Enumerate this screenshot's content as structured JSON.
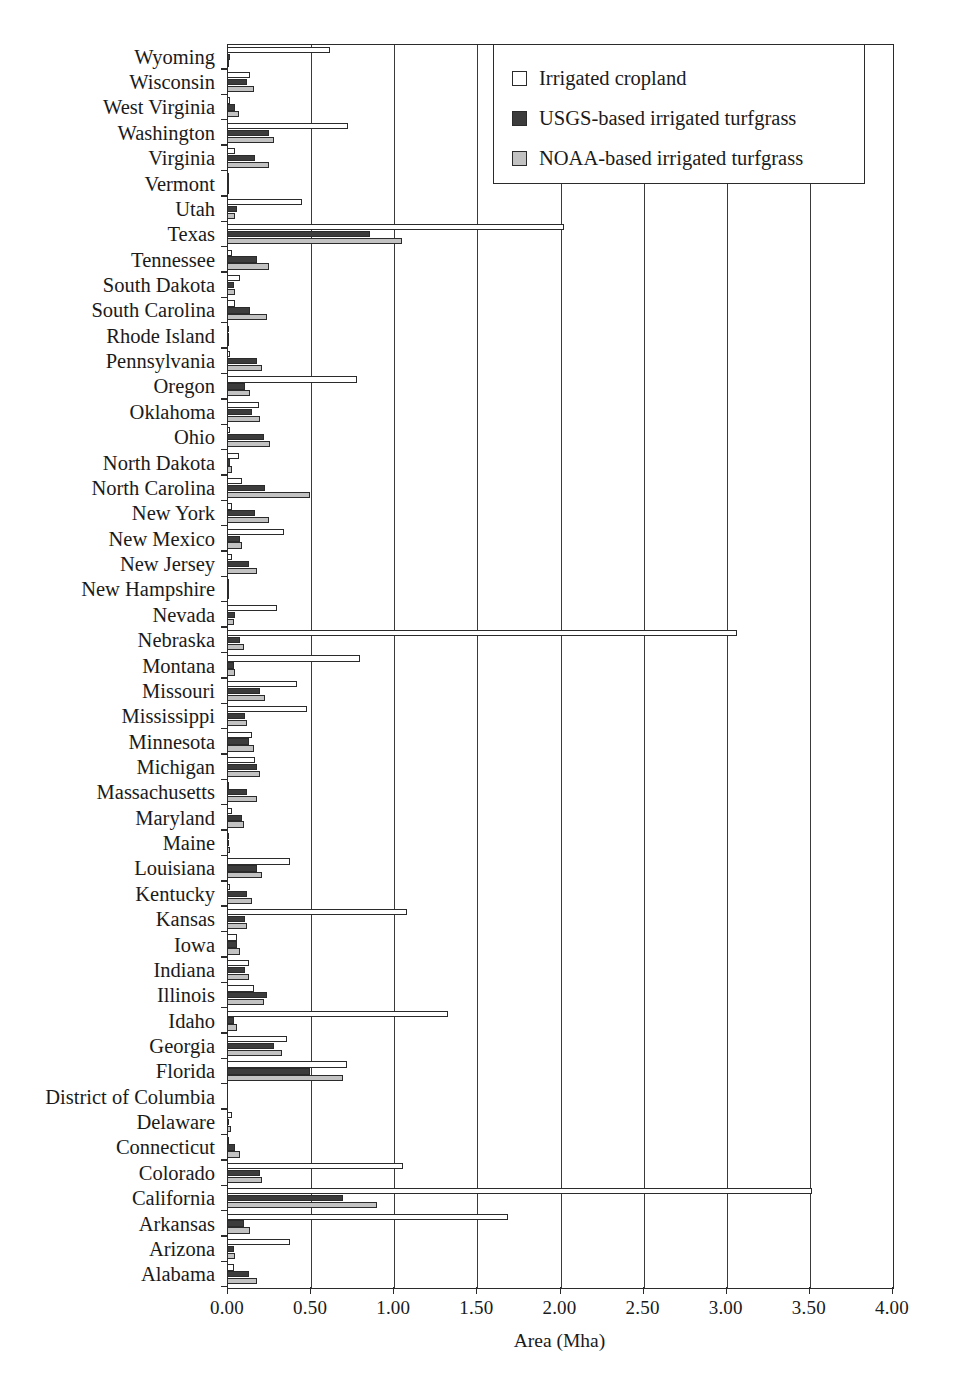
{
  "chart_data": {
    "type": "bar",
    "orientation": "horizontal",
    "title": "",
    "xlabel": "Area (Mha)",
    "ylabel": "",
    "xlim": [
      0.0,
      4.0
    ],
    "xticks": [
      "0.00",
      "0.50",
      "1.00",
      "1.50",
      "2.00",
      "2.50",
      "3.00",
      "3.50",
      "4.00"
    ],
    "xtick_values": [
      0.0,
      0.5,
      1.0,
      1.5,
      2.0,
      2.5,
      3.0,
      3.5,
      4.0
    ],
    "grid": "vertical",
    "legend_position": "top-right",
    "legend": [
      {
        "label": "Irrigated cropland",
        "color": "#ffffff"
      },
      {
        "label": "USGS-based irrigated turfgrass",
        "color": "#3c3c3c"
      },
      {
        "label": "NOAA-based irrigated turfgrass",
        "color": "#c2c2c2"
      }
    ],
    "categories": [
      "Wyoming",
      "Wisconsin",
      "West Virginia",
      "Washington",
      "Virginia",
      "Vermont",
      "Utah",
      "Texas",
      "Tennessee",
      "South Dakota",
      "South Carolina",
      "Rhode Island",
      "Pennsylvania",
      "Oregon",
      "Oklahoma",
      "Ohio",
      "North Dakota",
      "North Carolina",
      "New York",
      "New Mexico",
      "New Jersey",
      "New Hampshire",
      "Nevada",
      "Nebraska",
      "Montana",
      "Missouri",
      "Mississippi",
      "Minnesota",
      "Michigan",
      "Massachusetts",
      "Maryland",
      "Maine",
      "Louisiana",
      "Kentucky",
      "Kansas",
      "Iowa",
      "Indiana",
      "Illinois",
      "Idaho",
      "Georgia",
      "Florida",
      "District of Columbia",
      "Delaware",
      "Connecticut",
      "Colorado",
      "California",
      "Arkansas",
      "Arizona",
      "Alabama"
    ],
    "series": [
      {
        "name": "Irrigated cropland",
        "values": [
          0.62,
          0.14,
          0.02,
          0.73,
          0.05,
          0.005,
          0.45,
          2.03,
          0.03,
          0.08,
          0.05,
          0.005,
          0.02,
          0.78,
          0.19,
          0.02,
          0.07,
          0.09,
          0.03,
          0.34,
          0.03,
          0.004,
          0.3,
          3.07,
          0.8,
          0.42,
          0.48,
          0.15,
          0.17,
          0.01,
          0.03,
          0.01,
          0.38,
          0.02,
          1.08,
          0.06,
          0.13,
          0.16,
          1.33,
          0.36,
          0.72,
          0.0,
          0.03,
          0.01,
          1.06,
          3.52,
          1.69,
          0.38,
          0.04
        ]
      },
      {
        "name": "USGS-based irrigated turfgrass",
        "values": [
          0.02,
          0.12,
          0.05,
          0.25,
          0.17,
          0.002,
          0.06,
          0.86,
          0.18,
          0.04,
          0.14,
          0.01,
          0.18,
          0.11,
          0.15,
          0.22,
          0.02,
          0.23,
          0.17,
          0.08,
          0.13,
          0.012,
          0.05,
          0.08,
          0.04,
          0.2,
          0.11,
          0.13,
          0.18,
          0.12,
          0.09,
          0.015,
          0.18,
          0.12,
          0.11,
          0.06,
          0.11,
          0.24,
          0.04,
          0.28,
          0.5,
          0.0,
          0.015,
          0.05,
          0.2,
          0.7,
          0.1,
          0.04,
          0.13
        ]
      },
      {
        "name": "NOAA-based irrigated turfgrass",
        "values": [
          0.015,
          0.16,
          0.07,
          0.28,
          0.25,
          0.004,
          0.05,
          1.05,
          0.25,
          0.05,
          0.24,
          0.015,
          0.21,
          0.14,
          0.2,
          0.26,
          0.03,
          0.5,
          0.25,
          0.09,
          0.18,
          0.014,
          0.04,
          0.1,
          0.05,
          0.23,
          0.12,
          0.16,
          0.2,
          0.18,
          0.1,
          0.02,
          0.21,
          0.15,
          0.12,
          0.08,
          0.13,
          0.22,
          0.06,
          0.33,
          0.7,
          0.0,
          0.022,
          0.08,
          0.21,
          0.9,
          0.14,
          0.05,
          0.18
        ]
      }
    ]
  }
}
